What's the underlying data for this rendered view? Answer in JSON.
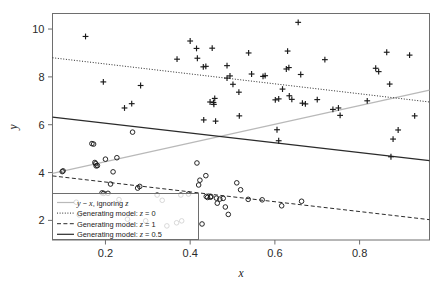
{
  "figure": {
    "background": "#ffffff",
    "frame_color": "#6e6e6e",
    "plot_type": "scatter-with-fitted-lines"
  },
  "axes": {
    "x": {
      "label": "x",
      "ticks": [
        0.2,
        0.4,
        0.6,
        0.8
      ],
      "tick_labels": [
        "0.2",
        "0.4",
        "0.6",
        "0.8"
      ],
      "range": [
        0.075,
        0.965
      ]
    },
    "y": {
      "label": "y",
      "ticks": [
        2,
        4,
        6,
        8,
        10
      ],
      "tick_labels": [
        "2",
        "4",
        "6",
        "8",
        "10"
      ],
      "range": [
        1.18,
        10.65
      ]
    }
  },
  "legend": {
    "border_color": "#6e6e6e",
    "items": [
      {
        "label": "y ~ x, ignoring z",
        "label_plain": "y ~ x, ignoring z",
        "style": "solid",
        "color": "#b9b9b9",
        "width": 1.2,
        "dash": ""
      },
      {
        "label": "Generating model: z = 0",
        "label_plain": "Generating model: z = 0",
        "style": "dotted",
        "color": "#2b2b2b",
        "width": 1.0,
        "dash": "1,1.6"
      },
      {
        "label": "Generating model: z = 1",
        "label_plain": "Generating model: z = 1",
        "style": "dashed",
        "color": "#2b2b2b",
        "width": 1.0,
        "dash": "4,2.4"
      },
      {
        "label": "Generating model: z = 0.5",
        "label_plain": "Generating model: z = 0.5",
        "style": "solid",
        "color": "#2b2b2b",
        "width": 1.2,
        "dash": ""
      }
    ]
  },
  "chart_data": {
    "type": "scatter",
    "title": "",
    "xlabel": "x",
    "ylabel": "y",
    "xlim": [
      0.075,
      0.965
    ],
    "ylim": [
      1.18,
      10.65
    ],
    "grid": false,
    "legend_position": "bottom-left",
    "series": [
      {
        "name": "z = 0",
        "marker": "plus",
        "color": "#1a1a1a",
        "points": [
          [
            0.153,
            9.69
          ],
          [
            0.195,
            7.79
          ],
          [
            0.283,
            7.64
          ],
          [
            0.245,
            6.7
          ],
          [
            0.262,
            6.88
          ],
          [
            0.369,
            8.74
          ],
          [
            0.4,
            9.5
          ],
          [
            0.415,
            9.19
          ],
          [
            0.417,
            8.78
          ],
          [
            0.431,
            8.42
          ],
          [
            0.437,
            8.44
          ],
          [
            0.452,
            9.2
          ],
          [
            0.447,
            6.95
          ],
          [
            0.455,
            6.93
          ],
          [
            0.458,
            7.1
          ],
          [
            0.456,
            6.85
          ],
          [
            0.432,
            6.2
          ],
          [
            0.46,
            6.15
          ],
          [
            0.487,
            8.47
          ],
          [
            0.487,
            7.95
          ],
          [
            0.494,
            8.04
          ],
          [
            0.501,
            7.69
          ],
          [
            0.515,
            7.36
          ],
          [
            0.516,
            6.37
          ],
          [
            0.538,
            9.0
          ],
          [
            0.545,
            8.12
          ],
          [
            0.572,
            8.02
          ],
          [
            0.577,
            8.05
          ],
          [
            0.601,
            7.04
          ],
          [
            0.609,
            7.08
          ],
          [
            0.605,
            5.79
          ],
          [
            0.609,
            5.33
          ],
          [
            0.618,
            7.49
          ],
          [
            0.627,
            8.33
          ],
          [
            0.633,
            8.39
          ],
          [
            0.63,
            9.08
          ],
          [
            0.634,
            7.21
          ],
          [
            0.64,
            7.06
          ],
          [
            0.655,
            10.28
          ],
          [
            0.661,
            8.1
          ],
          [
            0.665,
            6.9
          ],
          [
            0.672,
            6.87
          ],
          [
            0.7,
            7.05
          ],
          [
            0.718,
            8.72
          ],
          [
            0.737,
            6.64
          ],
          [
            0.75,
            6.7
          ],
          [
            0.754,
            6.39
          ],
          [
            0.818,
            7.0
          ],
          [
            0.838,
            8.36
          ],
          [
            0.845,
            8.22
          ],
          [
            0.864,
            9.03
          ],
          [
            0.871,
            7.7
          ],
          [
            0.874,
            4.66
          ],
          [
            0.879,
            5.4
          ],
          [
            0.891,
            5.78
          ],
          [
            0.918,
            8.91
          ],
          [
            0.93,
            6.37
          ]
        ]
      },
      {
        "name": "z = 1",
        "marker": "circle",
        "color": "#1a1a1a",
        "points": [
          [
            0.098,
            4.04
          ],
          [
            0.1,
            4.07
          ],
          [
            0.131,
            2.76
          ],
          [
            0.138,
            2.23
          ],
          [
            0.168,
            5.21
          ],
          [
            0.172,
            5.19
          ],
          [
            0.175,
            4.42
          ],
          [
            0.177,
            4.37
          ],
          [
            0.178,
            4.28
          ],
          [
            0.181,
            4.29
          ],
          [
            0.192,
            3.15
          ],
          [
            0.196,
            3.13
          ],
          [
            0.2,
            4.56
          ],
          [
            0.206,
            3.13
          ],
          [
            0.212,
            3.52
          ],
          [
            0.218,
            4.03
          ],
          [
            0.227,
            4.62
          ],
          [
            0.232,
            2.87
          ],
          [
            0.252,
            2.05
          ],
          [
            0.264,
            5.69
          ],
          [
            0.276,
            3.35
          ],
          [
            0.281,
            3.42
          ],
          [
            0.295,
            1.98
          ],
          [
            0.322,
            3.06
          ],
          [
            0.334,
            2.84
          ],
          [
            0.345,
            1.77
          ],
          [
            0.368,
            1.9
          ],
          [
            0.38,
            1.98
          ],
          [
            0.378,
            3.06
          ],
          [
            0.396,
            3.1
          ],
          [
            0.416,
            4.4
          ],
          [
            0.42,
            3.48
          ],
          [
            0.423,
            3.68
          ],
          [
            0.428,
            1.85
          ],
          [
            0.437,
            3.87
          ],
          [
            0.438,
            3.0
          ],
          [
            0.441,
            2.96
          ],
          [
            0.448,
            2.97
          ],
          [
            0.449,
            3.0
          ],
          [
            0.462,
            2.93
          ],
          [
            0.464,
            2.72
          ],
          [
            0.47,
            2.89
          ],
          [
            0.478,
            2.92
          ],
          [
            0.483,
            2.56
          ],
          [
            0.49,
            2.25
          ],
          [
            0.51,
            3.57
          ],
          [
            0.519,
            3.28
          ],
          [
            0.537,
            2.88
          ],
          [
            0.57,
            2.86
          ],
          [
            0.616,
            2.61
          ],
          [
            0.663,
            2.8
          ]
        ]
      }
    ],
    "lines": [
      {
        "name": "y ~ x, ignoring z",
        "style": "solid",
        "color": "#b9b9b9",
        "width": 1.3,
        "x0": 0.075,
        "y0": 3.97,
        "x1": 0.965,
        "y1": 7.45
      },
      {
        "name": "Generating model: z = 0",
        "style": "dotted",
        "color": "#2b2b2b",
        "width": 1.0,
        "x0": 0.075,
        "y0": 8.8,
        "x1": 0.965,
        "y1": 6.95
      },
      {
        "name": "Generating model: z = 1",
        "style": "dashed",
        "color": "#2b2b2b",
        "width": 1.0,
        "x0": 0.075,
        "y0": 3.86,
        "x1": 0.965,
        "y1": 2.03
      },
      {
        "name": "Generating model: z = 0.5",
        "style": "solid",
        "color": "#2b2b2b",
        "width": 1.3,
        "x0": 0.075,
        "y0": 6.32,
        "x1": 0.965,
        "y1": 4.5
      }
    ]
  }
}
